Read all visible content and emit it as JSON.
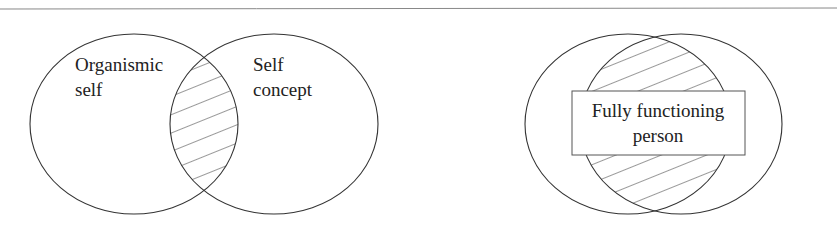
{
  "diagrams": [
    {
      "name": "incongruence",
      "left_set_label": [
        "Organismic",
        "self"
      ],
      "right_set_label": [
        "Self",
        "concept"
      ],
      "overlap": "small"
    },
    {
      "name": "congruence",
      "center_label": [
        "Fully functioning",
        "person"
      ],
      "overlap": "large"
    }
  ],
  "colors": {
    "line": "#333333",
    "rule": "#888888",
    "hatch": "#333333",
    "background": "#ffffff"
  }
}
